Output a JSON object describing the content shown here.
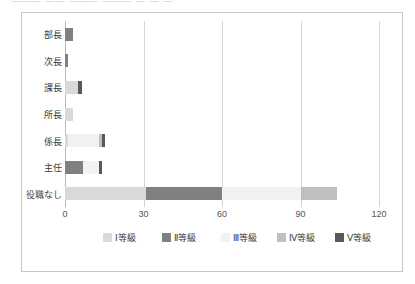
{
  "top_strip": {
    "ghost_text": "―――   ―― ――― ――― ― ― ―"
  },
  "chart_data": {
    "type": "bar",
    "orientation": "horizontal",
    "stacked": true,
    "title": "",
    "xlabel": "",
    "ylabel": "",
    "xlim": [
      0,
      120
    ],
    "xticks": [
      0,
      30,
      60,
      90,
      120
    ],
    "xtick_labels": [
      "0",
      "30",
      "60",
      "90",
      "120"
    ],
    "grid": true,
    "grid_axis": "x",
    "legend_position": "bottom",
    "categories": [
      "部長",
      "次長",
      "課長",
      "所長",
      "係長",
      "主任",
      "役職なし"
    ],
    "series": [
      {
        "name": "Ⅰ等級",
        "color": "#d9d9d9",
        "values": [
          0,
          0,
          5.0,
          3.0,
          1.0,
          0,
          31.0
        ]
      },
      {
        "name": "Ⅱ等級",
        "color": "#808080",
        "values": [
          3.0,
          1.2,
          0,
          0,
          0,
          7.0,
          29.0
        ]
      },
      {
        "name": "Ⅲ等級",
        "color": "#f2f2f2",
        "values": [
          0,
          0,
          0,
          0,
          12.0,
          6.0,
          30.0
        ]
      },
      {
        "name": "Ⅳ等級",
        "color": "#bfbfbf",
        "values": [
          0,
          0,
          0,
          0,
          1.0,
          0,
          14.0
        ]
      },
      {
        "name": "Ⅴ等級",
        "color": "#595959",
        "values": [
          0,
          0,
          1.5,
          0,
          1.2,
          1.2,
          0
        ]
      }
    ],
    "totals": [
      3.0,
      1.2,
      6.5,
      3.0,
      15.2,
      14.2,
      104.0
    ]
  },
  "colors": {
    "frame_border": "#c6c6c6",
    "gridline": "#d5d5d5",
    "axis": "#b9b9b9",
    "label_text": "#3c3c3c",
    "tick_text": "#555555",
    "background": "#ffffff"
  }
}
